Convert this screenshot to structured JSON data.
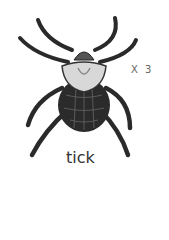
{
  "figure": {
    "label": "tick",
    "magnification": "X 3"
  }
}
